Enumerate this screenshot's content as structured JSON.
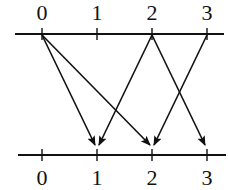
{
  "diagram": {
    "type": "mapping between two number lines",
    "top_line": {
      "labels": [
        "0",
        "1",
        "2",
        "3"
      ],
      "x_positions": [
        42,
        97,
        152,
        207
      ],
      "y": 34
    },
    "bottom_line": {
      "labels": [
        "0",
        "1",
        "2",
        "3"
      ],
      "x_positions": [
        42,
        97,
        152,
        207
      ],
      "y": 155
    },
    "arrows": [
      {
        "from": "0",
        "to": "1"
      },
      {
        "from": "0",
        "to": "2"
      },
      {
        "from": "2",
        "to": "1"
      },
      {
        "from": "2",
        "to": "3"
      },
      {
        "from": "3",
        "to": "2"
      }
    ],
    "colors": {
      "stroke": "#111111",
      "background": "#ffffff"
    }
  }
}
